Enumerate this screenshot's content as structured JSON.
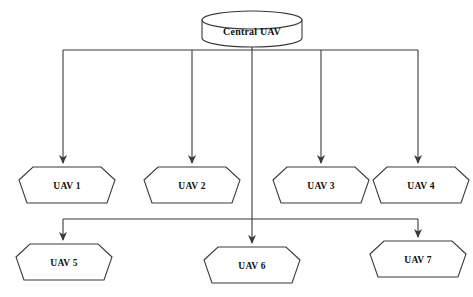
{
  "diagram": {
    "background_color": "#ffffff",
    "stroke_color": "#3a3a3a",
    "text_color": "#111111",
    "root": {
      "id": "central-uav",
      "label": "Central UAV",
      "shape": "cylinder",
      "cx": 252,
      "cy": 30,
      "width": 100,
      "height": 32
    },
    "nodes": [
      {
        "id": "uav-1",
        "label": "UAV 1",
        "shape": "heptagon",
        "cx": 67,
        "cy": 185,
        "width": 96,
        "height": 40
      },
      {
        "id": "uav-2",
        "label": "UAV 2",
        "shape": "heptagon",
        "cx": 192,
        "cy": 185,
        "width": 96,
        "height": 40
      },
      {
        "id": "uav-3",
        "label": "UAV 3",
        "shape": "heptagon",
        "cx": 321,
        "cy": 185,
        "width": 96,
        "height": 40
      },
      {
        "id": "uav-4",
        "label": "UAV 4",
        "shape": "heptagon",
        "cx": 421,
        "cy": 185,
        "width": 96,
        "height": 40
      },
      {
        "id": "uav-5",
        "label": "UAV 5",
        "shape": "heptagon",
        "cx": 64,
        "cy": 262,
        "width": 96,
        "height": 40
      },
      {
        "id": "uav-6",
        "label": "UAV 6",
        "shape": "heptagon",
        "cx": 252,
        "cy": 265,
        "width": 96,
        "height": 40
      },
      {
        "id": "uav-7",
        "label": "UAV 7",
        "shape": "heptagon",
        "cx": 418,
        "cy": 259,
        "width": 96,
        "height": 40
      }
    ],
    "buses": [
      {
        "id": "upper-bus",
        "y": 50,
        "x_start": 63,
        "x_end": 418
      },
      {
        "id": "lower-bus",
        "y": 219,
        "x_start": 63,
        "x_end": 418
      }
    ],
    "edges": [
      {
        "id": "edge-root-stem",
        "from": "central-uav",
        "to": "upper-bus",
        "arrow": false
      },
      {
        "id": "edge-uav-1",
        "from": "upper-bus",
        "to": "uav-1",
        "arrow": true
      },
      {
        "id": "edge-uav-2",
        "from": "upper-bus",
        "to": "uav-2",
        "arrow": true
      },
      {
        "id": "edge-uav-3",
        "from": "upper-bus",
        "to": "uav-3",
        "arrow": true
      },
      {
        "id": "edge-uav-4",
        "from": "upper-bus",
        "to": "uav-4",
        "arrow": true
      },
      {
        "id": "edge-center-stem",
        "from": "central-uav",
        "to": "uav-6",
        "arrow": true
      },
      {
        "id": "edge-uav-5",
        "from": "lower-bus",
        "to": "uav-5",
        "arrow": true
      },
      {
        "id": "edge-uav-7",
        "from": "lower-bus",
        "to": "uav-7",
        "arrow": true
      }
    ]
  }
}
